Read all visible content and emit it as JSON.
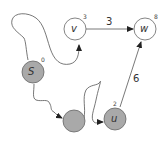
{
  "diagram": {
    "type": "shortest-path-graph",
    "colors": {
      "visited_fill": "#a9a9a9",
      "unvisited_fill": "#ffffff",
      "stroke": "#555555"
    },
    "nodes": [
      {
        "id": "s",
        "label": "S",
        "distance": "0",
        "visited": true
      },
      {
        "id": "v",
        "label": "v",
        "distance": "3",
        "visited": false
      },
      {
        "id": "w",
        "label": "w",
        "distance": "8",
        "visited": false
      },
      {
        "id": "x",
        "label": "",
        "distance": "",
        "visited": true
      },
      {
        "id": "u",
        "label": "u",
        "distance": "2",
        "visited": true
      }
    ],
    "edges": [
      {
        "from": "v",
        "to": "w",
        "weight": "3",
        "style": "straight"
      },
      {
        "from": "u",
        "to": "w",
        "weight": "6",
        "style": "straight"
      },
      {
        "from": "s",
        "to": "v",
        "weight": "",
        "style": "path"
      },
      {
        "from": "s",
        "to": "x",
        "weight": "",
        "style": "path"
      },
      {
        "from": "x",
        "to": "u",
        "weight": "",
        "style": "path"
      }
    ]
  }
}
